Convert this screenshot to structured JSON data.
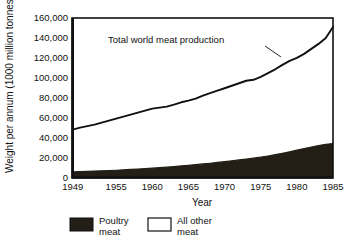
{
  "chart_data": {
    "type": "area",
    "title": "",
    "xlabel": "Year",
    "ylabel": "Weight per annum (1000 million tonnes)",
    "xlim": [
      1949,
      1985
    ],
    "ylim": [
      0,
      160000
    ],
    "grid": false,
    "stacked": true,
    "legend_position": "bottom",
    "annotation": "Total world meat production",
    "xticks": [
      "1949",
      "1955",
      "1960",
      "1965",
      "1970",
      "1975",
      "1980",
      "1985"
    ],
    "xtick_values": [
      1949,
      1955,
      1960,
      1965,
      1970,
      1975,
      1980,
      1985
    ],
    "yticks": [
      "0",
      "20,000",
      "40,000",
      "60,000",
      "80,000",
      "100,000",
      "120,000",
      "140,000",
      "160,000"
    ],
    "ytick_values": [
      0,
      20000,
      40000,
      60000,
      80000,
      100000,
      120000,
      140000,
      160000
    ],
    "x": [
      1949,
      1950,
      1951,
      1952,
      1953,
      1954,
      1955,
      1956,
      1957,
      1958,
      1959,
      1960,
      1961,
      1962,
      1963,
      1964,
      1965,
      1966,
      1967,
      1968,
      1969,
      1970,
      1971,
      1972,
      1973,
      1974,
      1975,
      1976,
      1977,
      1978,
      1979,
      1980,
      1981,
      1982,
      1983,
      1984,
      1985
    ],
    "series": [
      {
        "name": "Poultry meat",
        "color": "#231f16",
        "values": [
          5500,
          5800,
          6000,
          6300,
          6600,
          6900,
          7200,
          7600,
          8000,
          8400,
          8800,
          9300,
          9800,
          10300,
          10900,
          11500,
          12100,
          12800,
          13500,
          14200,
          15000,
          15800,
          16600,
          17500,
          18400,
          19300,
          20300,
          21500,
          22800,
          24200,
          25700,
          27300,
          28900,
          30500,
          32000,
          33200,
          34000
        ]
      },
      {
        "name": "All other meat",
        "color": "#ffffff",
        "values": [
          42500,
          44200,
          45500,
          46700,
          48400,
          50100,
          51800,
          53400,
          55000,
          56600,
          58200,
          59700,
          60200,
          60700,
          62100,
          63900,
          64900,
          66200,
          68500,
          70300,
          72000,
          73700,
          75400,
          77000,
          78600,
          78700,
          80700,
          83200,
          85700,
          88800,
          91300,
          92700,
          95100,
          98500,
          102000,
          106800,
          117000
        ]
      }
    ],
    "total": {
      "name": "Total world meat production",
      "values": [
        48000,
        50000,
        51500,
        53000,
        55000,
        57000,
        59000,
        61000,
        63000,
        65000,
        67000,
        69000,
        70000,
        71000,
        73000,
        75400,
        77000,
        79000,
        82000,
        84500,
        87000,
        89500,
        92000,
        94500,
        97000,
        98000,
        101000,
        104700,
        108500,
        113000,
        117000,
        120000,
        124000,
        129000,
        134000,
        140000,
        151000
      ]
    }
  },
  "axes": {
    "y_label": "Weight per annum (1000 million tonnes)",
    "x_label": "Year"
  },
  "annotation": {
    "text": "Total world meat production"
  },
  "legend": {
    "items": [
      {
        "label_line1": "Poultry",
        "label_line2": "meat",
        "swatch": "filled-black"
      },
      {
        "label_line1": "All other",
        "label_line2": "meat",
        "swatch": "outline-white"
      }
    ]
  }
}
